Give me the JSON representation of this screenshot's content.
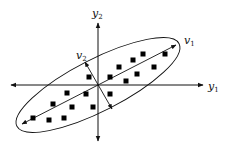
{
  "labels": {
    "y1": {
      "base": "y",
      "sub": "1"
    },
    "y2": {
      "base": "y",
      "sub": "2"
    },
    "v1": {
      "base": "v",
      "sub": "1"
    },
    "v2": {
      "base": "v",
      "sub": "2"
    }
  },
  "colors": {
    "stroke": "#111111",
    "point": "#000000",
    "background": "#ffffff"
  },
  "geometry": {
    "origin": [
      98,
      85
    ],
    "ellipse": {
      "cx": 98,
      "cy": 85,
      "rx": 91,
      "ry": 26,
      "rotation_deg": -27
    }
  },
  "points": [
    [
      33,
      118
    ],
    [
      49,
      120
    ],
    [
      64,
      118
    ],
    [
      53,
      104
    ],
    [
      72,
      107
    ],
    [
      93,
      107
    ],
    [
      67,
      93
    ],
    [
      86,
      94
    ],
    [
      89,
      77
    ],
    [
      110,
      94
    ],
    [
      110,
      77
    ],
    [
      119,
      67
    ],
    [
      126,
      81
    ],
    [
      133,
      60
    ],
    [
      137,
      74
    ],
    [
      143,
      54
    ],
    [
      154,
      67
    ],
    [
      165,
      54
    ]
  ]
}
